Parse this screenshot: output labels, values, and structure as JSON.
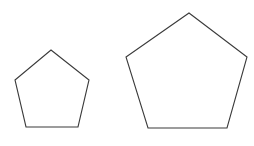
{
  "scene": {
    "title": "Two regular pentagons of different sizes",
    "background_color": "#ffffff",
    "width": 254,
    "height": 146
  },
  "style": {
    "stroke_color": "#3a3a3a",
    "fill_color": "#ffffff",
    "stroke_width": 1.1
  },
  "shapes": [
    {
      "id": "small-pentagon",
      "name": "small-pentagon",
      "kind": "regular-polygon",
      "sides": 5,
      "orientation": "apex-up",
      "center": {
        "x": 52,
        "y": 88.5
      },
      "circumradius": 38.5,
      "size_label": "small",
      "points": "51,50 89,80 78,127 26,127 15,80",
      "vertices": [
        {
          "label": "apex",
          "x": 51,
          "y": 50
        },
        {
          "label": "right",
          "x": 89,
          "y": 80
        },
        {
          "label": "bottom-right",
          "x": 78,
          "y": 127
        },
        {
          "label": "bottom-left",
          "x": 26,
          "y": 127
        },
        {
          "label": "left",
          "x": 15,
          "y": 80
        }
      ]
    },
    {
      "id": "large-pentagon",
      "name": "large-pentagon",
      "kind": "regular-polygon",
      "sides": 5,
      "orientation": "apex-up",
      "center": {
        "x": 186.5,
        "y": 77
      },
      "circumradius": 64,
      "size_label": "large",
      "points": "189,13 247,57 227,128 148,128 126,57",
      "vertices": [
        {
          "label": "apex",
          "x": 189,
          "y": 13
        },
        {
          "label": "right",
          "x": 247,
          "y": 57
        },
        {
          "label": "bottom-right",
          "x": 227,
          "y": 128
        },
        {
          "label": "bottom-left",
          "x": 148,
          "y": 128
        },
        {
          "label": "left",
          "x": 126,
          "y": 57
        }
      ]
    }
  ]
}
